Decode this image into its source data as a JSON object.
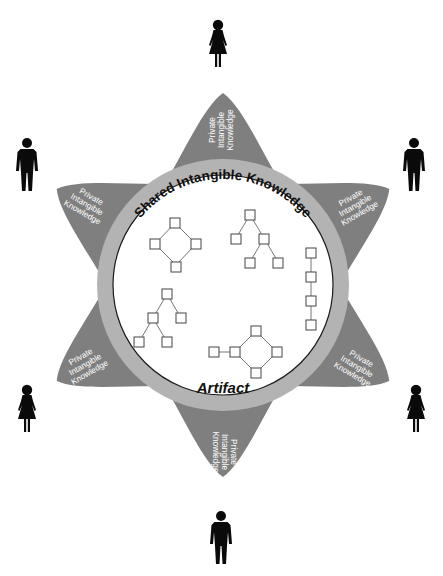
{
  "diagram": {
    "ring_label": "Shared Intangible Knowledge",
    "core_label": "Artifact",
    "petal_label_lines": [
      "Private",
      "Intangible",
      "Knowledge"
    ],
    "petals": [
      {
        "position": "top",
        "lines": [
          "Private",
          "Intangible",
          "Knowledge"
        ]
      },
      {
        "position": "upper-right",
        "lines": [
          "Private",
          "Intangible",
          "Knowledge"
        ]
      },
      {
        "position": "lower-right",
        "lines": [
          "Private",
          "Intangible",
          "Knowledge"
        ]
      },
      {
        "position": "bottom",
        "lines": [
          "Private",
          "Intangible",
          "Knowledge"
        ]
      },
      {
        "position": "lower-left",
        "lines": [
          "Private",
          "Intangible",
          "Knowledge"
        ]
      },
      {
        "position": "upper-left",
        "lines": [
          "Private",
          "Intangible",
          "Knowledge"
        ]
      }
    ],
    "people": [
      {
        "position": "top",
        "icon": "woman-icon"
      },
      {
        "position": "upper-right",
        "icon": "man-icon"
      },
      {
        "position": "lower-right",
        "icon": "woman-icon"
      },
      {
        "position": "bottom",
        "icon": "man-icon"
      },
      {
        "position": "lower-left",
        "icon": "woman-icon"
      },
      {
        "position": "upper-left",
        "icon": "man-icon"
      }
    ],
    "structures": [
      {
        "name": "diamond-graph",
        "nodes": 4
      },
      {
        "name": "binary-tree-upper",
        "nodes": 5
      },
      {
        "name": "linear-chain",
        "nodes": 4
      },
      {
        "name": "binary-tree-lower",
        "nodes": 5
      },
      {
        "name": "diamond-with-tail",
        "nodes": 5
      }
    ],
    "colors": {
      "petal": "#7f7f7f",
      "ring": "#b3b3b3",
      "core": "#ffffff",
      "figure": "#0a0a0a"
    }
  }
}
